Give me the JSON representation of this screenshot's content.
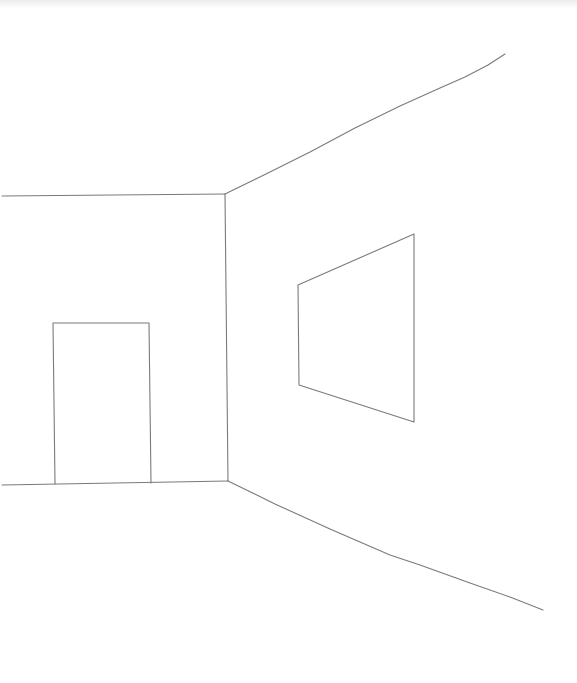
{
  "drawing": {
    "subject": "perspective room sketch",
    "canvas": {
      "width": 577,
      "height": 683,
      "background": "#ffffff"
    },
    "stroke": {
      "color": "#7a7a7a",
      "width": 1.1
    },
    "elements": {
      "back_wall_ceiling_edge": {
        "points": [
          [
            2,
            196
          ],
          [
            225,
            194
          ]
        ]
      },
      "back_wall_floor_edge": {
        "points": [
          [
            2,
            485
          ],
          [
            228,
            481
          ]
        ]
      },
      "corner_edge": {
        "points": [
          [
            225,
            194
          ],
          [
            228,
            481
          ]
        ]
      },
      "side_wall_ceiling_edge": {
        "points": [
          [
            225,
            194
          ],
          [
            270,
            172
          ],
          [
            310,
            152
          ],
          [
            355,
            128
          ],
          [
            400,
            106
          ],
          [
            440,
            88
          ],
          [
            465,
            77
          ],
          [
            488,
            65
          ],
          [
            505,
            54
          ]
        ]
      },
      "side_wall_floor_edge": {
        "points": [
          [
            228,
            481
          ],
          [
            275,
            504
          ],
          [
            330,
            529
          ],
          [
            390,
            555
          ],
          [
            420,
            565
          ],
          [
            470,
            583
          ],
          [
            510,
            597
          ],
          [
            543,
            610
          ]
        ]
      },
      "door": {
        "points": [
          [
            55,
            484
          ],
          [
            53,
            323
          ],
          [
            149,
            323
          ],
          [
            151,
            483
          ]
        ]
      },
      "window": {
        "points": [
          [
            298,
            285
          ],
          [
            414,
            234
          ],
          [
            414,
            422
          ],
          [
            299,
            385
          ]
        ]
      }
    }
  }
}
